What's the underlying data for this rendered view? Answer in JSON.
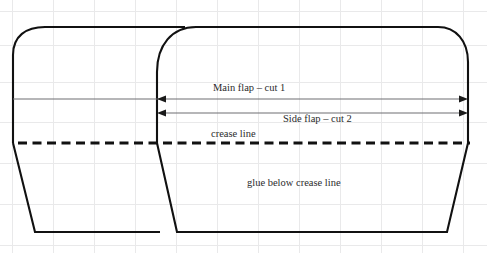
{
  "diagram": {
    "background_color": "#ffffff",
    "line_color": "#111111",
    "grid_color": "#e9e9ea",
    "dimension_color": "#6f6f72",
    "labels": {
      "main_flap": "Main flap – cut 1",
      "side_flap": "Side flap – cut 2",
      "crease": "crease line",
      "glue": "glue below crease line"
    },
    "dimensions": [
      {
        "name": "main-flap-dimension",
        "label": "Main flap – cut 1",
        "y": 99,
        "x_start": 13,
        "x_end": 468,
        "arrow_start": 157,
        "arrow_end": 468
      },
      {
        "name": "side-flap-dimension",
        "label": "Side flap – cut 2",
        "y": 113,
        "x_start": 157,
        "x_end": 468,
        "arrow_start": 157,
        "arrow_end": 468
      }
    ],
    "crease_line": {
      "y": 143,
      "x_start": 18,
      "x_end": 470,
      "style": "dashed"
    },
    "shapes": [
      {
        "name": "left-flap-outline",
        "top_y": 27,
        "bottom_y": 233,
        "left_x": 13,
        "right_x": 185
      },
      {
        "name": "right-flap-outline",
        "top_y": 27,
        "bottom_y": 233,
        "left_x": 157,
        "right_x": 468
      }
    ]
  }
}
